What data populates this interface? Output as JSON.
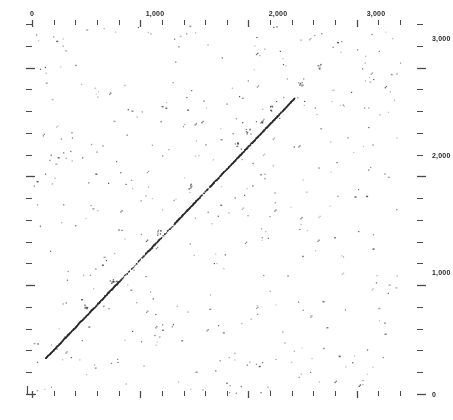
{
  "chart_data": {
    "type": "scatter",
    "title": "",
    "subtitle": "",
    "xlabel": "",
    "ylabel": "",
    "grid": false,
    "legend": null,
    "xaxis": {
      "position": "top",
      "min": 0,
      "max": 3400,
      "tick_labels": [
        "0",
        "1,000",
        "2,000",
        "3,000"
      ],
      "tick_label_values": [
        0,
        1000,
        2000,
        3000
      ],
      "minor_tick_interval": 200,
      "minor_tick_values": [
        0,
        200,
        400,
        600,
        800,
        1000,
        1200,
        1400,
        1600,
        1800,
        2000,
        2200,
        2400,
        2600,
        2800,
        3000,
        3200,
        3400
      ]
    },
    "yaxis": {
      "position": "right",
      "min": 0,
      "max": 3400,
      "tick_labels": [
        "3,000",
        "2,000",
        "1,000",
        "0"
      ],
      "tick_label_values": [
        3000,
        2000,
        1000,
        0
      ],
      "minor_tick_interval": 200,
      "minor_tick_values": [
        0,
        200,
        400,
        600,
        800,
        1000,
        1200,
        1400,
        1600,
        1800,
        2000,
        2200,
        2400,
        2600,
        2800,
        3000,
        3200,
        3400
      ]
    },
    "series": [
      {
        "name": "main-diagonal",
        "kind": "line-of-identity",
        "x_start": 120,
        "y_start": 330,
        "x_end": 2420,
        "y_end": 2720,
        "note": "Dominant self-match diagonal drawn as a dense dotted band"
      },
      {
        "name": "background-matches",
        "kind": "noise-points",
        "approx_count": 420,
        "note": "Randomly distributed short-word match points filling the matrix"
      }
    ],
    "colors": {
      "background": "#ffffff",
      "points": "#3a3a3a",
      "diagonal": "#2a2a2a",
      "axis": "#4a4a4a",
      "label_text": "#2b2b2b"
    }
  },
  "axes": {
    "top_labels": [
      {
        "text": "0",
        "x": 32
      },
      {
        "text": "1,000",
        "x": 155
      },
      {
        "text": "2,000",
        "x": 278
      },
      {
        "text": "3,000",
        "x": 376
      }
    ],
    "right_labels": [
      {
        "text": "3,000",
        "y": 38
      },
      {
        "text": "2,000",
        "y": 155
      },
      {
        "text": "1,000",
        "y": 272
      },
      {
        "text": "0",
        "y": 394
      }
    ]
  }
}
